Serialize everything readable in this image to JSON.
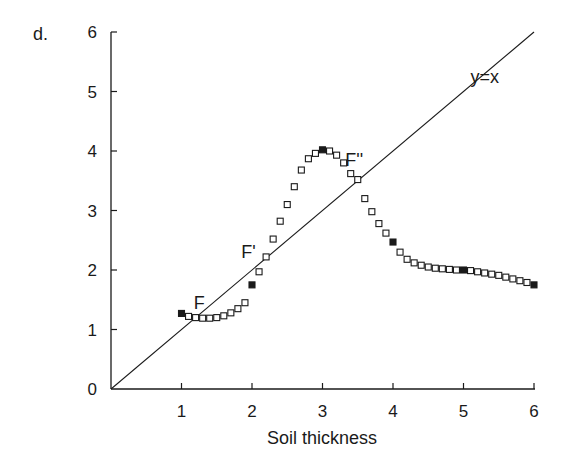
{
  "panel_label": "d.",
  "chart_data": {
    "type": "scatter",
    "title": "",
    "xlabel": "Soil thickness",
    "ylabel": "",
    "xlim": [
      0,
      6
    ],
    "ylim": [
      0,
      6
    ],
    "x_ticks": [
      "1",
      "2",
      "3",
      "4",
      "5",
      "6"
    ],
    "y_ticks": [
      "0",
      "1",
      "2",
      "3",
      "4",
      "5",
      "6"
    ],
    "grid": false,
    "legend": null,
    "reference_line": {
      "label": "y=x",
      "slope": 1,
      "intercept": 0
    },
    "annotations": [
      {
        "text": "F",
        "x": 1.25,
        "y": 1.35
      },
      {
        "text": "F'",
        "x": 1.95,
        "y": 2.2
      },
      {
        "text": "F''",
        "x": 3.45,
        "y": 3.75
      }
    ],
    "series": [
      {
        "name": "open-squares",
        "marker": "open-square",
        "x": [
          1.1,
          1.2,
          1.3,
          1.4,
          1.5,
          1.6,
          1.7,
          1.8,
          1.9,
          2.1,
          2.2,
          2.3,
          2.4,
          2.5,
          2.6,
          2.7,
          2.8,
          2.9,
          3.1,
          3.2,
          3.3,
          3.4,
          3.5,
          3.6,
          3.7,
          3.8,
          3.9,
          4.1,
          4.2,
          4.3,
          4.4,
          4.5,
          4.6,
          4.7,
          4.8,
          4.9,
          5.1,
          5.2,
          5.3,
          5.4,
          5.5,
          5.6,
          5.7,
          5.8,
          5.9
        ],
        "y": [
          1.22,
          1.2,
          1.19,
          1.19,
          1.2,
          1.23,
          1.28,
          1.35,
          1.45,
          1.97,
          2.22,
          2.52,
          2.82,
          3.1,
          3.4,
          3.68,
          3.87,
          3.96,
          4.0,
          3.93,
          3.8,
          3.62,
          3.52,
          3.2,
          2.98,
          2.78,
          2.62,
          2.3,
          2.18,
          2.12,
          2.08,
          2.05,
          2.03,
          2.02,
          2.01,
          2.0,
          1.99,
          1.97,
          1.95,
          1.93,
          1.91,
          1.88,
          1.85,
          1.82,
          1.79
        ]
      },
      {
        "name": "filled-squares",
        "marker": "filled-square",
        "x": [
          1,
          2,
          3,
          4,
          5,
          6
        ],
        "y": [
          1.27,
          1.75,
          4.02,
          2.47,
          2.0,
          1.75
        ]
      }
    ]
  },
  "colors": {
    "ink": "#1a1a1a",
    "background": "#ffffff"
  }
}
